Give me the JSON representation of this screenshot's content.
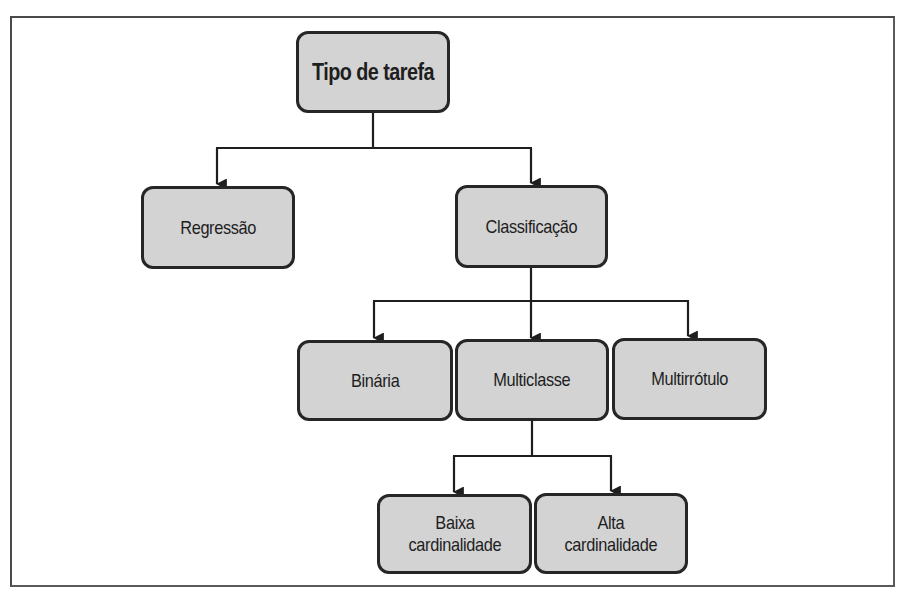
{
  "diagram": {
    "title": "Tipo de tarefa",
    "colors": {
      "node_fill": "#d3d3d3",
      "node_border": "#262626",
      "connector": "#1e1e1e",
      "frame": "#5a5a5a",
      "background": "#ffffff"
    },
    "nodes": {
      "root": {
        "label": "Tipo de tarefa"
      },
      "regressao": {
        "label": "Regressão"
      },
      "classificacao": {
        "label": "Classificação"
      },
      "binaria": {
        "label": "Binária"
      },
      "multiclasse": {
        "label": "Multiclasse"
      },
      "multirrotulo": {
        "label": "Multirrótulo"
      },
      "baixa": {
        "label": "Baixa\ncardinalidade"
      },
      "alta": {
        "label": "Alta\ncardinalidade"
      }
    },
    "edges": [
      {
        "from": "Tipo de tarefa",
        "to": "Regressão"
      },
      {
        "from": "Tipo de tarefa",
        "to": "Classificação"
      },
      {
        "from": "Classificação",
        "to": "Binária"
      },
      {
        "from": "Classificação",
        "to": "Multiclasse"
      },
      {
        "from": "Classificação",
        "to": "Multirrótulo"
      },
      {
        "from": "Multiclasse",
        "to": "Baixa cardinalidade"
      },
      {
        "from": "Multiclasse",
        "to": "Alta cardinalidade"
      }
    ]
  }
}
